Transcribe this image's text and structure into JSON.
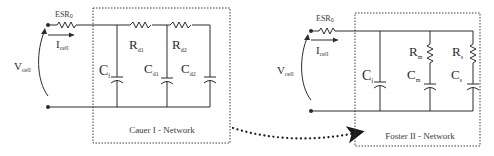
{
  "cauer": {
    "esr_label": "ESR",
    "esr_sub": "0",
    "current_label": "I",
    "current_sub": "cell",
    "voltage_label": "V",
    "voltage_sub": "cell",
    "rd1_label": "R",
    "rd1_sub": "d1",
    "rd2_label": "R",
    "rd2_sub": "d2",
    "cf_label": "C",
    "cf_sub": "f",
    "cd1_label": "C",
    "cd1_sub": "d1",
    "cd2_label": "C",
    "cd2_sub": "d2",
    "network_title": "Cauer I - Network"
  },
  "foster": {
    "esr_label": "ESR",
    "esr_sub": "0",
    "current_label": "I",
    "current_sub": "cell",
    "voltage_label": "V",
    "voltage_sub": "cell",
    "cf_label": "C",
    "cf_sub": "f",
    "rm_label": "R",
    "rm_sub": "m",
    "cm_label": "C",
    "cm_sub": "m",
    "rs_label": "R",
    "rs_sub": "s",
    "cs_label": "C",
    "cs_sub": "s",
    "network_title": "Foster II - Network"
  },
  "colors": {
    "line": "#2b2b2b",
    "background": "#ffffff"
  }
}
